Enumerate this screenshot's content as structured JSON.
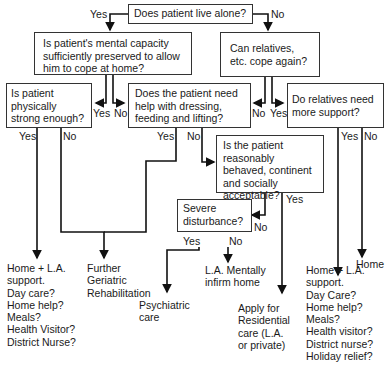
{
  "questions": {
    "q1": "Does patient live alone?",
    "q2": "Is patient's mental capacity sufficiently preserved to allow him to cope at home?",
    "q3": "Can relatives, etc. cope again?",
    "q4": "Is patient physically strong enough?",
    "q5": "Does the patient need help with dressing, feeding and lifting?",
    "q6": "Do relatives need more support?",
    "q7": "Is the patient reasonably behaved, continent and socially acceptable?",
    "q8": "Severe disturbance?"
  },
  "labels": {
    "yes": "Yes",
    "no": "No"
  },
  "outcomes": {
    "home_la_support": "Home + L.A.\nsupport.\nDay care?\nHome help?\nMeals?\nHealth Visitor?\nDistrict Nurse?",
    "further_rehab": "Further\nGeriatric\nRehabilitation",
    "psychiatric": "Psychiatric\ncare",
    "la_mentally_infirm": "L.A. Mentally\ninfirm home",
    "residential": "Apply for\nResidential\ncare (L.A.\nor private)",
    "home": "Home",
    "home_la_support_2": "Home + L.A.\nsupport.\nDay Care?\nHome help?\nMeals?\nHealth visitor?\nDistrict nurse?\nHoliday relief?"
  }
}
